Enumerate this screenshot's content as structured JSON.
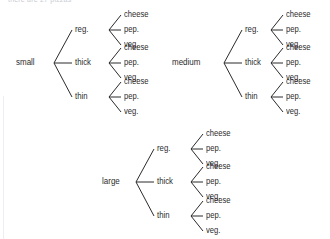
{
  "diagram": {
    "kind": "tree-diagram",
    "title_partial": "there are 27 pizzas",
    "colors": {
      "background": "#ffffff",
      "ink": "#2b2b2b",
      "faint": "#c9ccd2"
    },
    "crust_options": [
      "reg.",
      "thick",
      "thin"
    ],
    "topping_options": [
      "cheese",
      "pep.",
      "veg."
    ],
    "trees": [
      {
        "id": "small",
        "root_label": "small",
        "branches": [
          {
            "crust": "reg.",
            "toppings": [
              "cheese",
              "pep.",
              "veg."
            ]
          },
          {
            "crust": "thick",
            "toppings": [
              "cheese",
              "pep.",
              "veg."
            ]
          },
          {
            "crust": "thin",
            "toppings": [
              "cheese",
              "pep.",
              "veg."
            ]
          }
        ]
      },
      {
        "id": "medium",
        "root_label": "medium",
        "branches": [
          {
            "crust": "reg.",
            "toppings": [
              "cheese",
              "pep.",
              "veg."
            ]
          },
          {
            "crust": "thick",
            "toppings": [
              "cheese",
              "pep.",
              "veg."
            ]
          },
          {
            "crust": "thin",
            "toppings": [
              "cheese",
              "pep.",
              "veg."
            ]
          }
        ]
      },
      {
        "id": "large",
        "root_label": "large",
        "branches": [
          {
            "crust": "reg.",
            "toppings": [
              "cheese",
              "pep.",
              "veg."
            ]
          },
          {
            "crust": "thick",
            "toppings": [
              "cheese",
              "pep.",
              "veg."
            ]
          },
          {
            "crust": "thin",
            "toppings": [
              "cheese",
              "pep.",
              "veg."
            ]
          }
        ]
      }
    ]
  }
}
